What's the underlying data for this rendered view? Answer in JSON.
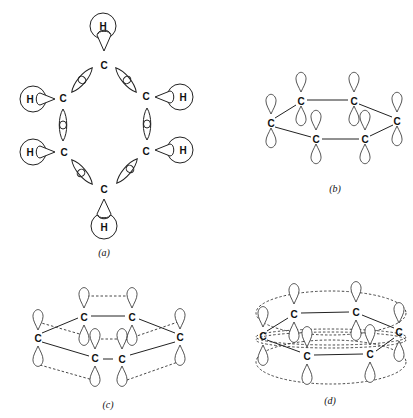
{
  "figure": {
    "panels": [
      {
        "id": "a",
        "caption": "(a)",
        "description": "sigma-bond framework of benzene: sp2 hybrid overlaps between six C atoms and 1s orbitals of six H atoms"
      },
      {
        "id": "b",
        "caption": "(b)",
        "description": "six carbon 2p orbitals perpendicular to ring plane"
      },
      {
        "id": "c",
        "caption": "(c)",
        "description": "pairwise side-by-side overlap of p orbitals (localized pi bonds)"
      },
      {
        "id": "d",
        "caption": "(d)",
        "description": "continuous delocalized pi electron clouds above and below the ring"
      }
    ],
    "atoms": {
      "carbon": "C",
      "hydrogen": "H"
    }
  }
}
